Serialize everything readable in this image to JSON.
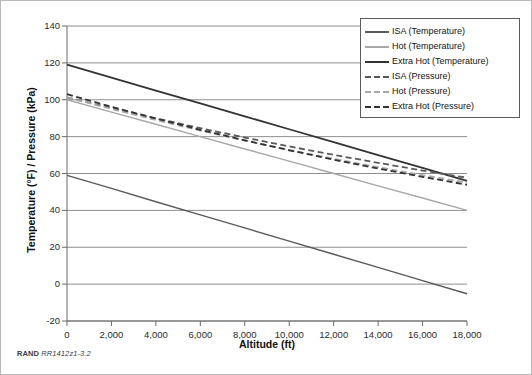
{
  "figure": {
    "credit_org": "RAND",
    "credit_id": "RR1412z1-3.2"
  },
  "chart_data": {
    "type": "line",
    "title": "",
    "xlabel": "Altitude (ft)",
    "ylabel": "Temperature (°F) / Pressure (kPa)",
    "xlim": [
      0,
      18000
    ],
    "ylim": [
      -20,
      140
    ],
    "xticks": [
      0,
      2000,
      4000,
      6000,
      8000,
      10000,
      12000,
      14000,
      16000,
      18000
    ],
    "xtick_labels": [
      "0",
      "2,000",
      "4,000",
      "6,000",
      "8,000",
      "10,000",
      "12,000",
      "14,000",
      "16,000",
      "18,000"
    ],
    "yticks": [
      -20,
      0,
      20,
      40,
      60,
      80,
      100,
      120,
      140
    ],
    "ytick_labels": [
      "-20",
      "0",
      "20",
      "40",
      "60",
      "80",
      "100",
      "120",
      "140"
    ],
    "grid": "horizontal",
    "legend_position": "top-right",
    "x": [
      0,
      2000,
      4000,
      6000,
      8000,
      10000,
      12000,
      14000,
      16000,
      18000
    ],
    "series": [
      {
        "name": "ISA (Temperature)",
        "label": "ISA (Temperature)",
        "style": "solid",
        "color": "#595959",
        "width": 1.4,
        "values": [
          59.0,
          51.9,
          44.7,
          37.6,
          30.5,
          23.3,
          16.2,
          9.1,
          1.9,
          -5.2
        ]
      },
      {
        "name": "Hot (Temperature)",
        "label": "Hot (Temperature)",
        "style": "solid",
        "color": "#a8a8a8",
        "width": 1.4,
        "values": [
          100.0,
          93.3,
          86.7,
          80.0,
          73.3,
          66.7,
          60.0,
          53.3,
          46.7,
          40.0
        ]
      },
      {
        "name": "Extra Hot (Temperature)",
        "label": "Extra Hot (Temperature)",
        "style": "solid",
        "color": "#333333",
        "width": 1.8,
        "values": [
          119.0,
          112.0,
          105.0,
          98.0,
          91.0,
          84.0,
          77.0,
          70.0,
          63.0,
          56.0
        ]
      },
      {
        "name": "ISA (Pressure)",
        "label": "ISA (Pressure)",
        "style": "dashed",
        "color": "#595959",
        "width": 1.8,
        "values": [
          101.3,
          95.5,
          89.9,
          84.6,
          79.5,
          74.7,
          70.1,
          65.8,
          61.6,
          57.7
        ]
      },
      {
        "name": "Hot (Pressure)",
        "label": "Hot (Pressure)",
        "style": "dashed",
        "color": "#a8a8a8",
        "width": 1.8,
        "values": [
          101.3,
          95.0,
          89.0,
          83.3,
          77.9,
          72.8,
          68.0,
          63.4,
          59.1,
          55.1
        ]
      },
      {
        "name": "Extra Hot (Pressure)",
        "label": "Extra Hot (Pressure)",
        "style": "dashed",
        "color": "#333333",
        "width": 1.8,
        "values": [
          103.0,
          96.2,
          89.8,
          83.7,
          78.0,
          72.6,
          67.5,
          62.7,
          58.2,
          53.9
        ]
      }
    ]
  }
}
